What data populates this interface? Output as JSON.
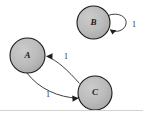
{
  "figure": {
    "kind": "directed-state-transition-graph",
    "background_color": "#ffffff",
    "node_fill_color": "#b9b9b9",
    "node_stroke_color": "#1a1a1a",
    "edge_color": "#2a2a2a",
    "label_color": "#1c1c1c",
    "rule_color": "#d2d2d2"
  },
  "nodes": [
    {
      "id": "A",
      "label": "A",
      "cx": 27.5,
      "cy": 55.5,
      "r": 17.5
    },
    {
      "id": "B",
      "label": "B",
      "cx": 93.5,
      "cy": 22.5,
      "r": 16.5
    },
    {
      "id": "C",
      "label": "C",
      "cx": 95.0,
      "cy": 93.0,
      "r": 17.0
    }
  ],
  "edges": [
    {
      "id": "c-to-a",
      "from": "C",
      "to": "A",
      "weight": "1",
      "weight_x": 66,
      "weight_y": 57,
      "direction": "right-to-left"
    },
    {
      "id": "a-to-c",
      "from": "A",
      "to": "C",
      "weight": "1",
      "weight_x": 48,
      "weight_y": 95,
      "direction": "left-to-right"
    },
    {
      "id": "b-self-loop",
      "from": "B",
      "to": "B",
      "weight": "1",
      "weight_x": 134,
      "weight_y": 25,
      "direction": "self-loop"
    }
  ]
}
